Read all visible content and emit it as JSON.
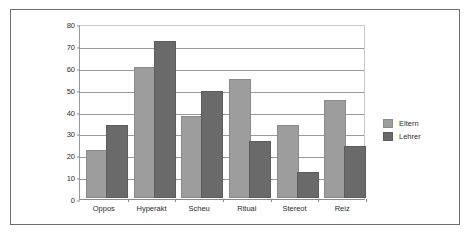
{
  "chart_data": {
    "type": "bar",
    "title": "",
    "xlabel": "",
    "ylabel": "",
    "ylim": [
      0,
      80
    ],
    "ytick_step": 10,
    "yticks": [
      0,
      10,
      20,
      30,
      40,
      50,
      60,
      70,
      80
    ],
    "grid": true,
    "legend_position": "right",
    "categories": [
      "Oppos",
      "Hyperakt",
      "Scheu",
      "Ritual",
      "Stereot",
      "Reiz"
    ],
    "series": [
      {
        "name": "Eltern",
        "color": "#9d9d9d",
        "values": [
          21,
          59,
          36.5,
          53.5,
          32.5,
          44
        ]
      },
      {
        "name": "Lehrer",
        "color": "#6a6a6a",
        "values": [
          32.5,
          71,
          48,
          25,
          11,
          23
        ]
      }
    ]
  },
  "legend": {
    "items": [
      {
        "label": "Eltern"
      },
      {
        "label": "Lehrer"
      }
    ]
  }
}
